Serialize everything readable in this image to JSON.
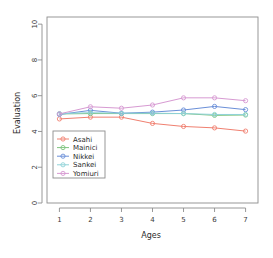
{
  "chart_data": {
    "type": "line",
    "title": "",
    "xlabel": "Ages",
    "ylabel": "Evaluation",
    "x": [
      1,
      2,
      3,
      4,
      5,
      6,
      7
    ],
    "xtick_labels": [
      "1",
      "2",
      "3",
      "4",
      "5",
      "6",
      "7"
    ],
    "ytick_labels": [
      "0",
      "2",
      "4",
      "6",
      "8",
      "10"
    ],
    "ytick_values": [
      0,
      2,
      4,
      6,
      8,
      10
    ],
    "xlim": [
      0.6,
      7.4
    ],
    "ylim": [
      0,
      10.4
    ],
    "grid": false,
    "legend_position": "upper-left-inside",
    "marker": "open-circle",
    "series": [
      {
        "name": "Asahi",
        "color": "#f08070",
        "values": [
          4.7,
          4.8,
          4.8,
          4.45,
          4.28,
          4.2,
          4.02
        ]
      },
      {
        "name": "Mainici",
        "color": "#7fc47f",
        "values": [
          4.98,
          5.0,
          5.0,
          5.0,
          5.0,
          4.9,
          4.92
        ]
      },
      {
        "name": "Nikkei",
        "color": "#6a8fd8",
        "values": [
          4.95,
          5.18,
          5.02,
          5.08,
          5.2,
          5.4,
          5.22
        ]
      },
      {
        "name": "Sankei",
        "color": "#8fd2d8",
        "values": [
          5.0,
          5.05,
          5.02,
          5.02,
          5.0,
          4.95,
          4.95
        ]
      },
      {
        "name": "Yomiuri",
        "color": "#d79ad2",
        "values": [
          4.98,
          5.38,
          5.3,
          5.48,
          5.88,
          5.88,
          5.72
        ]
      }
    ]
  },
  "legend": {
    "entries": [
      {
        "label": "Asahi"
      },
      {
        "label": "Mainici"
      },
      {
        "label": "Nikkei"
      },
      {
        "label": "Sankei"
      },
      {
        "label": "Yomiuri"
      }
    ]
  }
}
